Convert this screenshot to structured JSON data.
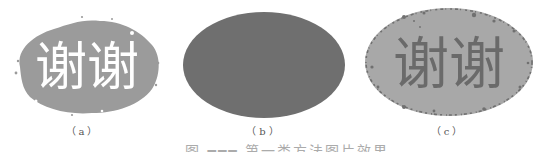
{
  "figure": {
    "panels": [
      {
        "id": "a",
        "label": "（a）",
        "text": "谢谢",
        "description": "original image: white characters on irregular gray blob",
        "background_color": "#9b9b9b",
        "text_color": "#ffffff"
      },
      {
        "id": "b",
        "label": "（b）",
        "text": "",
        "description": "solid dark gray ellipse mask",
        "background_color": "#6f6f6f"
      },
      {
        "id": "c",
        "label": "（c）",
        "text": "谢谢",
        "description": "result: dark characters on light gray ellipse with speckled border",
        "background_color": "#a8a8a8",
        "text_color": "#6a6a6a",
        "border_speckle_color": "#707070"
      }
    ],
    "caption": "图 ━━━  第一类方法图片效果"
  }
}
